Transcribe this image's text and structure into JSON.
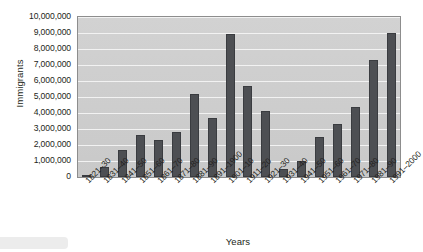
{
  "chart_data": {
    "type": "bar",
    "title": "",
    "xlabel": "Years",
    "ylabel": "Immigrants",
    "ylim": [
      0,
      10000000
    ],
    "ytick_step": 1000000,
    "grid": true,
    "legend": false,
    "bar_color": "#4d4f53",
    "plot_bg_color": "#cdcdcd",
    "gridline_color": "#f2f2f2",
    "categories": [
      "1821–30",
      "1831–40",
      "1841–50",
      "1851–60",
      "1861–70",
      "1871–80",
      "1881–90",
      "1891–1900",
      "1901–10",
      "1911–20",
      "1921–30",
      "1931–40",
      "1941–50",
      "1951–60",
      "1961–70",
      "1971–80",
      "1981–90",
      "1991–2000"
    ],
    "values": [
      150000,
      600000,
      1700000,
      2600000,
      2300000,
      2800000,
      5200000,
      3700000,
      8950000,
      5700000,
      4100000,
      500000,
      1000000,
      2500000,
      3300000,
      4400000,
      7300000,
      9000000
    ],
    "ytick_labels": [
      "10,000,000",
      "9,000,000",
      "8,000,000",
      "7,000,000",
      "6,000,000",
      "5,000,000",
      "4,000,000",
      "3,000,000",
      "2,000,000",
      "1,000,000",
      "0"
    ],
    "ytick_values": [
      10000000,
      9000000,
      8000000,
      7000000,
      6000000,
      5000000,
      4000000,
      3000000,
      2000000,
      1000000,
      0
    ]
  }
}
